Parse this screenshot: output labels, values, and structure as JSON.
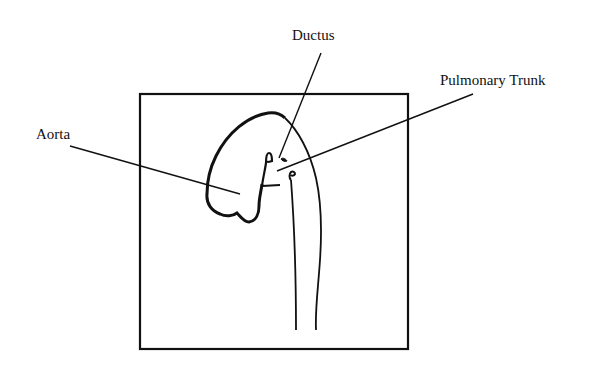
{
  "diagram": {
    "type": "anatomical line drawing",
    "labels": {
      "ductus": "Ductus",
      "pulmonary_trunk": "Pulmonary Trunk",
      "aorta": "Aorta"
    },
    "colors": {
      "stroke": "#111111",
      "background": "#ffffff"
    }
  }
}
